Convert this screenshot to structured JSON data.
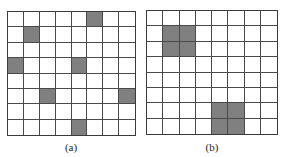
{
  "figure": {
    "panels": [
      {
        "id": "a",
        "caption": "(a)",
        "rows": 8,
        "cols": 8,
        "filled_cells": [
          [
            0,
            5
          ],
          [
            1,
            1
          ],
          [
            3,
            0
          ],
          [
            3,
            4
          ],
          [
            5,
            2
          ],
          [
            5,
            7
          ],
          [
            7,
            4
          ]
        ]
      },
      {
        "id": "b",
        "caption": "(b)",
        "rows": 8,
        "cols": 8,
        "filled_cells": [
          [
            1,
            1
          ],
          [
            1,
            2
          ],
          [
            2,
            1
          ],
          [
            2,
            2
          ],
          [
            6,
            4
          ],
          [
            6,
            5
          ],
          [
            7,
            4
          ],
          [
            7,
            5
          ]
        ]
      }
    ],
    "colors": {
      "filled": "#808080",
      "empty": "#ffffff",
      "grid_line": "#4a4a4a"
    }
  }
}
